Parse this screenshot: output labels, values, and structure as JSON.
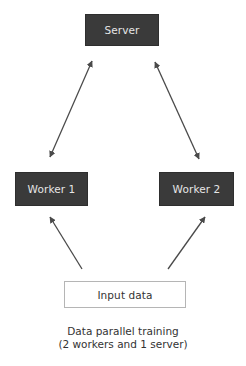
{
  "diagram": {
    "title": "Data parallel training",
    "nodes": [
      {
        "id": "server",
        "label": "Server",
        "style": "dark"
      },
      {
        "id": "worker1",
        "label": "Worker 1",
        "style": "dark"
      },
      {
        "id": "worker2",
        "label": "Worker 2",
        "style": "dark"
      },
      {
        "id": "input",
        "label": "Input data",
        "style": "light"
      }
    ],
    "edges": [
      {
        "from": "server",
        "to": "worker1",
        "type": "bidirectional"
      },
      {
        "from": "server",
        "to": "worker2",
        "type": "bidirectional"
      },
      {
        "from": "input",
        "to": "worker1",
        "type": "directed"
      },
      {
        "from": "input",
        "to": "worker2",
        "type": "directed"
      }
    ],
    "caption": {
      "line1": "Data parallel training",
      "line2": "(2 workers and 1 server)"
    }
  },
  "colors": {
    "node_dark_bg": "#3a3a3a",
    "node_dark_text": "#e6e6e6",
    "node_light_border": "#b5b5b5",
    "arrow": "#4a4a4a",
    "caption_text": "#333333"
  }
}
